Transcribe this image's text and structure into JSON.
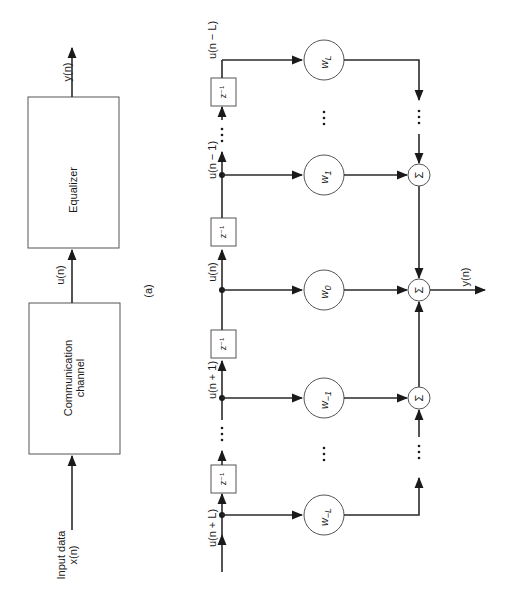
{
  "figure_a": {
    "label": "(a)",
    "equalizer_label": "Equalizer",
    "channel_label_line1": "Communication",
    "channel_label_line2": "channel",
    "input_label_line1": "Input data",
    "input_label_line2": "x(n)",
    "mid_signal": "u(n)",
    "output_signal": "y(n)"
  },
  "figure_b": {
    "taps": [
      {
        "signal": "u(n − L)",
        "weight": "w",
        "weight_sub": "L"
      },
      {
        "signal": "u(n − 1)",
        "weight": "w",
        "weight_sub": "1"
      },
      {
        "signal": "u(n)",
        "weight": "w",
        "weight_sub": "0"
      },
      {
        "signal": "u(n + 1)",
        "weight": "w",
        "weight_sub": "−1"
      },
      {
        "signal": "u(n + L)",
        "weight": "w",
        "weight_sub": "−L"
      }
    ],
    "delay_label": "z⁻¹",
    "sum_symbol": "Σ",
    "ellipsis": "⋯",
    "output_signal": "y(n)"
  }
}
